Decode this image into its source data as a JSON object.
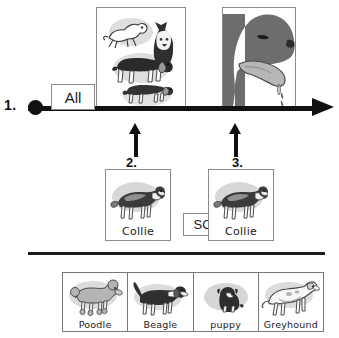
{
  "diagram": {
    "title_text": "",
    "timeline": {
      "step1_label": "1.",
      "start_marker": "filled-circle",
      "all_box_label": "All"
    },
    "top_panels": [
      {
        "name": "assorted-dogs-panel",
        "caption": "",
        "contents": [
          "jumping-terrier",
          "husky",
          "hound",
          "dachshund"
        ]
      },
      {
        "name": "salivating-dog-head-panel",
        "caption": "",
        "contents": [
          "dog-head-profile",
          "tongue",
          "saliva-drop",
          "saliva-drop"
        ]
      }
    ],
    "arrows": [
      {
        "label": "2.",
        "points_to": "assorted-dogs-panel"
      },
      {
        "label": "3.",
        "points_to": "salivating-dog-head-panel"
      }
    ],
    "cards": [
      {
        "label": "Collie",
        "art": "collie-dog"
      },
      {
        "label": "Collie",
        "art": "collie-dog"
      }
    ],
    "so_box_label": "SO",
    "bottom_strip": [
      {
        "label": "Poodle",
        "art": "poodle-dog"
      },
      {
        "label": "Beagle",
        "art": "beagle-dog"
      },
      {
        "label": "puppy",
        "art": "puppy-dog"
      },
      {
        "label": "Greyhound",
        "art": "greyhound-dog"
      }
    ],
    "colors": {
      "line": "#111111",
      "box_border": "#8a8a8a",
      "divider": "#1b1b1b",
      "background": "#ffffff",
      "art_fill_dark": "#3a3a3a",
      "art_fill_mid": "#8e8e8e",
      "art_fill_light": "#c9c9c9"
    }
  }
}
